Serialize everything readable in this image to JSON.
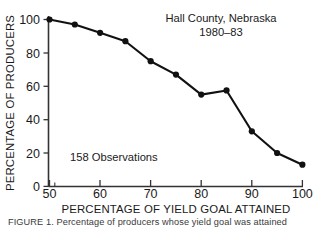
{
  "figure": {
    "title_line1": "Hall County, Nebraska",
    "title_line2": "1980–83",
    "annotation": "158 Observations",
    "x_axis_title": "PERCENTAGE OF YIELD GOAL ATTAINED",
    "y_axis_title": "PERCENTAGE OF PRODUCERS",
    "caption": "FIGURE 1. Percentage of producers whose yield goal was attained",
    "line_color": "#111111",
    "marker_color": "#111111",
    "axis_color": "#333333",
    "background_color": "#ffffff"
  },
  "chart_data": {
    "type": "line",
    "xlabel": "PERCENTAGE OF YIELD GOAL ATTAINED",
    "ylabel": "PERCENTAGE OF PRODUCERS",
    "xlim": [
      50,
      100
    ],
    "ylim": [
      0,
      100
    ],
    "xticks": [
      50,
      60,
      70,
      80,
      90,
      100
    ],
    "xtick_labels": [
      "50",
      "60",
      "70",
      "80",
      "90",
      "100"
    ],
    "x_minor_ticks": [
      55,
      65,
      75,
      85,
      95
    ],
    "yticks": [
      0,
      20,
      40,
      60,
      80,
      100
    ],
    "ytick_labels": [
      "0",
      "20",
      "40",
      "60",
      "80",
      "100"
    ],
    "grid": false,
    "legend": false,
    "markers": "filled-circle",
    "observations": 158,
    "x": [
      50,
      55,
      60,
      65,
      70,
      75,
      80,
      85,
      90,
      95,
      100
    ],
    "values": [
      100,
      97,
      92,
      87,
      75,
      67,
      55,
      57.5,
      33,
      20,
      13
    ],
    "series": [
      {
        "name": "Percentage of producers",
        "x": [
          50,
          55,
          60,
          65,
          70,
          75,
          80,
          85,
          90,
          95,
          100
        ],
        "values": [
          100,
          97,
          92,
          87,
          75,
          67,
          55,
          57.5,
          33,
          20,
          13
        ]
      }
    ],
    "annotations": [
      "Hall County, Nebraska",
      "1980–83",
      "158 Observations"
    ]
  }
}
